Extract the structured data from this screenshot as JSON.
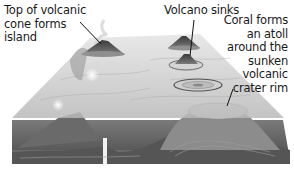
{
  "diagram": {
    "style": "grayscale",
    "colors": {
      "background": "#ffffff",
      "water_plane": "#c9c9c9",
      "seabed_dark": "#5c5c5c",
      "seabed_mid": "#8a8a8a",
      "text": "#1a1a1a",
      "leader_line": "#111111"
    },
    "labels": [
      {
        "id": "volcanic-island",
        "lines": [
          "Top of volcanic",
          "cone forms",
          "island"
        ]
      },
      {
        "id": "volcano-sinks",
        "lines": [
          "Volcano sinks"
        ]
      },
      {
        "id": "coral-atoll",
        "lines": [
          "Coral forms",
          "an atoll",
          "around the",
          "sunken",
          "volcanic",
          "crater rim"
        ]
      }
    ],
    "stages": [
      {
        "name": "Volcanic island",
        "description": "Top of volcanic cone forms island"
      },
      {
        "name": "Sinking volcano",
        "description": "Volcano sinks"
      },
      {
        "name": "Fringing reef ring",
        "description": "Coral ring around sinking peak"
      },
      {
        "name": "Atoll",
        "description": "Coral forms an atoll around the sunken volcanic crater rim"
      }
    ]
  }
}
